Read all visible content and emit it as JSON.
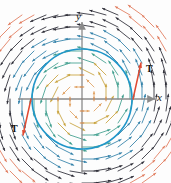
{
  "figure": {
    "kind": "vector-field-plot",
    "width": 171,
    "height": 183,
    "background": "#fdfdfd"
  },
  "axes": {
    "x_label": "x",
    "y_label": "y",
    "origin": {
      "x": 82,
      "y": 99
    },
    "x_axis": {
      "x1": 18,
      "x2": 155,
      "y": 99
    },
    "y_axis": {
      "x": 82,
      "y1": 22,
      "y2": 172
    },
    "color": "#8a8a8a",
    "tick_color": "#d98a4a",
    "ticks_x": [
      -2,
      -1,
      1,
      2
    ],
    "ticks_y": [
      -2,
      -1,
      1,
      2
    ],
    "tick_spacing_px": 12
  },
  "circle": {
    "label": "C",
    "center": {
      "x": 82,
      "y": 99
    },
    "radius": 50,
    "color": "#2196c9",
    "stroke_width": 1.6
  },
  "tangent_vectors": [
    {
      "label": "T",
      "color": "#e04a32",
      "anchor": {
        "x": 133,
        "y": 99
      },
      "tip": {
        "x": 141,
        "y": 63
      },
      "label_pos": {
        "x": 146,
        "y": 64
      }
    },
    {
      "label": "T",
      "color": "#e04a32",
      "anchor": {
        "x": 31,
        "y": 99
      },
      "tip": {
        "x": 23,
        "y": 135
      },
      "label_pos": {
        "x": 11,
        "y": 124
      }
    }
  ],
  "vector_field": {
    "type": "rotational",
    "direction": "counterclockwise",
    "formula_hint": "F = (-y, x)",
    "grid_spacing_px": 12,
    "magnitude_scale": 0.62,
    "color_bands": [
      {
        "name": "inner",
        "max_radius": 18,
        "color": "#e0a060"
      },
      {
        "name": "inner-mid",
        "max_radius": 34,
        "color": "#c8a23c"
      },
      {
        "name": "mid",
        "max_radius": 50,
        "color": "#3f9e8e"
      },
      {
        "name": "outer-mid",
        "max_radius": 70,
        "color": "#2f7fa8"
      },
      {
        "name": "outer",
        "max_radius": 92,
        "color": "#2b2b35"
      },
      {
        "name": "far",
        "max_radius": 999,
        "color": "#e0795a"
      }
    ]
  },
  "chart_data": {
    "type": "scatter",
    "title": "",
    "xlabel": "x",
    "ylabel": "y",
    "xlim": [
      -5.3,
      6.1
    ],
    "ylim": [
      -6.1,
      6.4
    ],
    "grid": false,
    "legend": null,
    "annotations": [
      "T",
      "T"
    ],
    "series": [
      {
        "name": "circle C",
        "type": "line",
        "note": "circle of radius 4.17 units centered at origin",
        "color": "#2196c9"
      },
      {
        "name": "vector field F = (-y, x)",
        "type": "quiver",
        "note": "counterclockwise rotational field sampled on a square grid",
        "color": "multi"
      },
      {
        "name": "tangent vectors T",
        "type": "arrow",
        "points": [
          [
            4.17,
            0
          ],
          [
            -4.17,
            0
          ]
        ],
        "color": "#e04a32"
      }
    ]
  }
}
